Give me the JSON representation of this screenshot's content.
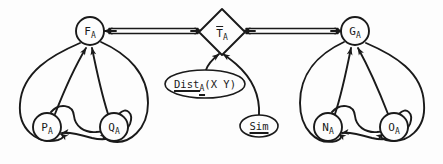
{
  "diagram": {
    "type": "graph-diagram",
    "title": "",
    "background_color": "#fdfdfd",
    "stroke_color": "#1a1a1a",
    "nodes": [
      {
        "id": "F_A",
        "label": "F",
        "subscript": "A",
        "shape": "circle",
        "cx": 90,
        "cy": 31,
        "r": 14,
        "decoration": "none"
      },
      {
        "id": "P_A",
        "label": "P",
        "subscript": "A",
        "shape": "circle",
        "cx": 47,
        "cy": 127,
        "r": 14,
        "decoration": "none"
      },
      {
        "id": "Q_A",
        "label": "Q",
        "subscript": "A",
        "shape": "circle",
        "cx": 114,
        "cy": 127,
        "r": 14,
        "decoration": "none"
      },
      {
        "id": "T_A",
        "label": "T",
        "subscript": "A",
        "shape": "diamond",
        "cx": 222,
        "cy": 32,
        "r": 22,
        "decoration": "overline"
      },
      {
        "id": "Dist",
        "label": "Dist",
        "subscript": "A",
        "args": "(X Y)",
        "shape": "ellipse",
        "cx": 205,
        "cy": 84,
        "rx": 40,
        "ry": 14,
        "decoration": "underline"
      },
      {
        "id": "Sim",
        "label": "Sim",
        "subscript": "",
        "shape": "ellipse",
        "cx": 259,
        "cy": 126,
        "rx": 19,
        "ry": 11,
        "decoration": "underline"
      },
      {
        "id": "G_A",
        "label": "G",
        "subscript": "A",
        "shape": "circle",
        "cx": 355,
        "cy": 31,
        "r": 14,
        "decoration": "none"
      },
      {
        "id": "N_A",
        "label": "N",
        "subscript": "A",
        "shape": "circle",
        "cx": 328,
        "cy": 127,
        "r": 14,
        "decoration": "none"
      },
      {
        "id": "O_A",
        "label": "O",
        "subscript": "A",
        "shape": "circle",
        "cx": 394,
        "cy": 127,
        "r": 14,
        "decoration": "none"
      }
    ],
    "edges": [
      {
        "from": "F_A",
        "to": "T_A",
        "style": "double-line",
        "arrowheads": "both"
      },
      {
        "from": "T_A",
        "to": "G_A",
        "style": "double-line",
        "arrowheads": "both"
      },
      {
        "from": "Dist",
        "to": "T_A",
        "style": "curve",
        "arrowheads": "to"
      },
      {
        "from": "Sim",
        "to": "T_A",
        "style": "curve",
        "arrowheads": "to"
      },
      {
        "from": "P_A",
        "to": "F_A",
        "style": "curve",
        "arrowheads": "to"
      },
      {
        "from": "Q_A",
        "to": "F_A",
        "style": "curve",
        "arrowheads": "to"
      },
      {
        "from": "F_A",
        "to": "P_A",
        "style": "outer-arc",
        "arrowheads": "to"
      },
      {
        "from": "F_A",
        "to": "Q_A",
        "style": "outer-arc",
        "arrowheads": "to"
      },
      {
        "from": "P_A",
        "to": "Q_A",
        "style": "cross-curve",
        "arrowheads": "to"
      },
      {
        "from": "Q_A",
        "to": "P_A",
        "style": "cross-curve",
        "arrowheads": "to"
      },
      {
        "from": "N_A",
        "to": "G_A",
        "style": "curve",
        "arrowheads": "to"
      },
      {
        "from": "O_A",
        "to": "G_A",
        "style": "curve",
        "arrowheads": "to"
      },
      {
        "from": "G_A",
        "to": "N_A",
        "style": "outer-arc",
        "arrowheads": "to"
      },
      {
        "from": "G_A",
        "to": "O_A",
        "style": "outer-arc",
        "arrowheads": "to"
      },
      {
        "from": "N_A",
        "to": "O_A",
        "style": "cross-curve",
        "arrowheads": "to"
      },
      {
        "from": "O_A",
        "to": "N_A",
        "style": "cross-curve",
        "arrowheads": "to"
      }
    ]
  },
  "labels": {
    "f_a": {
      "base": "F",
      "sub": "A"
    },
    "p_a": {
      "base": "P",
      "sub": "A"
    },
    "q_a": {
      "base": "Q",
      "sub": "A"
    },
    "t_a": {
      "base": "T",
      "sub": "A"
    },
    "g_a": {
      "base": "G",
      "sub": "A"
    },
    "n_a": {
      "base": "N",
      "sub": "A"
    },
    "o_a": {
      "base": "O",
      "sub": "A"
    },
    "dist": {
      "base": "Dist",
      "sub": "A",
      "args": "(X Y)"
    },
    "sim": {
      "base": "Sim"
    }
  }
}
